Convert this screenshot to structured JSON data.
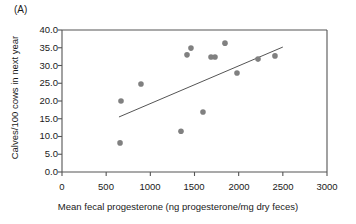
{
  "panel": {
    "label": "(A)"
  },
  "chart_data": {
    "type": "scatter",
    "title": "",
    "subtitle": "",
    "xlabel": "Mean fecal progesterone (ng progesterone/mg dry feces)",
    "ylabel": "Calves/100 cows in next year",
    "xlim": [
      0,
      3000
    ],
    "ylim": [
      0.0,
      40.0
    ],
    "xticks": [
      0,
      500,
      1000,
      1500,
      2000,
      2500,
      3000
    ],
    "xticklabels": [
      "0",
      "500",
      "1000",
      "1500",
      "2000",
      "2500",
      "3000"
    ],
    "yticks": [
      0.0,
      5.0,
      10.0,
      15.0,
      20.0,
      25.0,
      30.0,
      35.0,
      40.0
    ],
    "yticklabels": [
      "0.0",
      "5.0",
      "10.0",
      "15.0",
      "20.0",
      "25.0",
      "30.0",
      "35.0",
      "40.0"
    ],
    "grid": false,
    "legend": null,
    "marker": {
      "shape": "circle",
      "color": "#808080",
      "size": 5
    },
    "points": [
      {
        "x": 657,
        "y": 8.2
      },
      {
        "x": 668,
        "y": 20.0
      },
      {
        "x": 894,
        "y": 24.8
      },
      {
        "x": 1347,
        "y": 11.5
      },
      {
        "x": 1415,
        "y": 33.0
      },
      {
        "x": 1460,
        "y": 34.9
      },
      {
        "x": 1596,
        "y": 16.9
      },
      {
        "x": 1687,
        "y": 32.4
      },
      {
        "x": 1732,
        "y": 32.4
      },
      {
        "x": 1845,
        "y": 36.3
      },
      {
        "x": 1981,
        "y": 27.9
      },
      {
        "x": 2219,
        "y": 31.8
      },
      {
        "x": 2411,
        "y": 32.7
      }
    ],
    "trendline": {
      "type": "linear-fit",
      "color": "#555555",
      "x_start": 645,
      "y_start": 15.5,
      "x_end": 2500,
      "y_end": 35.2
    },
    "axis_color": "#555555",
    "background": "#ffffff"
  }
}
